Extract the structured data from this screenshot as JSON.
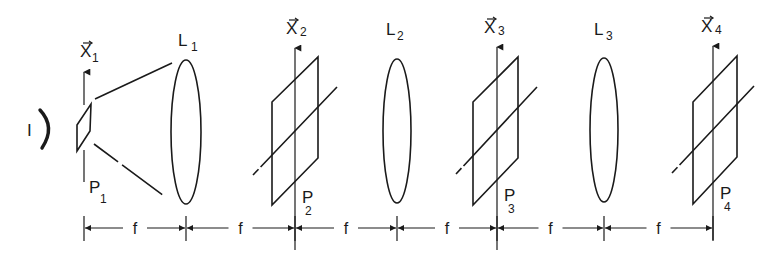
{
  "diagram": {
    "type": "optical-system",
    "source": {
      "label": "I"
    },
    "planes": [
      {
        "id": "P1",
        "label": "P",
        "subscript": "1",
        "axis_label": "X",
        "axis_subscript": "1",
        "has_vector_arrow": true,
        "style": "small-aperture"
      },
      {
        "id": "P2",
        "label": "P",
        "subscript": "2",
        "axis_label": "X",
        "axis_subscript": "2",
        "has_vector_arrow": true,
        "style": "plane-with-diagonal"
      },
      {
        "id": "P3",
        "label": "P",
        "subscript": "3",
        "axis_label": "X",
        "axis_subscript": "3",
        "has_vector_arrow": true,
        "style": "plane-with-diagonal"
      },
      {
        "id": "P4",
        "label": "P",
        "subscript": "4",
        "axis_label": "X",
        "axis_subscript": "4",
        "has_vector_arrow": true,
        "style": "plane-with-diagonal"
      }
    ],
    "lenses": [
      {
        "id": "L1",
        "label": "L",
        "subscript": "1"
      },
      {
        "id": "L2",
        "label": "L",
        "subscript": "2"
      },
      {
        "id": "L3",
        "label": "L",
        "subscript": "3"
      }
    ],
    "sequence": [
      "P1",
      "L1",
      "P2",
      "L2",
      "P3",
      "L3",
      "P4"
    ],
    "spacing": {
      "label": "f",
      "count": 6
    }
  }
}
